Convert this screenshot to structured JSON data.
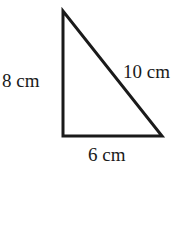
{
  "diagram": {
    "type": "right-triangle",
    "vertices": {
      "top": [
        63,
        11
      ],
      "bottom_left": [
        63,
        136
      ],
      "bottom_right": [
        162,
        136
      ]
    },
    "stroke_color": "#1a1a1a",
    "labels": {
      "left_side": "8 cm",
      "hypotenuse": "10 cm",
      "base": "6 cm"
    }
  }
}
